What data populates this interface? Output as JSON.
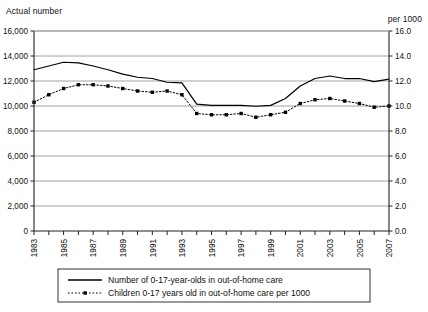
{
  "header": {
    "left_caption": "Actual number",
    "right_caption": "per 1000"
  },
  "chart_data": {
    "type": "line",
    "title": "",
    "xlabel": "",
    "ylabel": "Actual number",
    "y2label": "per 1000",
    "grid": true,
    "legend_position": "bottom",
    "xlim": [
      1983,
      2007
    ],
    "ylim": [
      0,
      16000
    ],
    "y2lim": [
      0.0,
      16.0
    ],
    "yticks": [
      0,
      2000,
      4000,
      6000,
      8000,
      10000,
      12000,
      14000,
      16000
    ],
    "yticklabels": [
      "0",
      "2,000",
      "4,000",
      "6,000",
      "8,000",
      "10,000",
      "12,000",
      "14,000",
      "16,000"
    ],
    "y2ticks": [
      0.0,
      2.0,
      4.0,
      6.0,
      8.0,
      10.0,
      12.0,
      14.0,
      16.0
    ],
    "y2ticklabels": [
      "0.0",
      "2.0",
      "4.0",
      "6.0",
      "8.0",
      "10.0",
      "12.0",
      "14.0",
      "16.0"
    ],
    "x": [
      1983,
      1984,
      1985,
      1986,
      1987,
      1988,
      1989,
      1990,
      1991,
      1992,
      1993,
      1994,
      1995,
      1996,
      1997,
      1998,
      1999,
      2000,
      2001,
      2002,
      2003,
      2004,
      2005,
      2006,
      2007
    ],
    "xticklabels": [
      "1983",
      "",
      "1985",
      "",
      "1987",
      "",
      "1989",
      "",
      "1991",
      "",
      "1993",
      "",
      "1995",
      "",
      "1997",
      "",
      "1999",
      "",
      "2001",
      "",
      "2003",
      "",
      "2005",
      "",
      "2007"
    ],
    "series": [
      {
        "name": "Number of 0-17-year-olds in out-of-home care",
        "axis": "left",
        "style": "solid",
        "marker": "none",
        "color": "#000000",
        "values": [
          12900,
          13200,
          13500,
          13450,
          13200,
          12900,
          12550,
          12300,
          12200,
          11900,
          11850,
          10150,
          10050,
          10050,
          10050,
          9980,
          10050,
          10600,
          11600,
          12200,
          12400,
          12200,
          12200,
          11950,
          12150
        ]
      },
      {
        "name": "Children 0-17 years old in out-of-home care per 1000",
        "axis": "right",
        "style": "dotted",
        "marker": "square",
        "color": "#000000",
        "values": [
          10.3,
          10.9,
          11.4,
          11.7,
          11.7,
          11.6,
          11.4,
          11.2,
          11.1,
          11.2,
          10.9,
          9.4,
          9.3,
          9.3,
          9.4,
          9.1,
          9.3,
          9.5,
          10.2,
          10.5,
          10.6,
          10.4,
          10.2,
          9.9,
          10.0
        ]
      }
    ]
  },
  "legend": {
    "items": [
      {
        "label": "Number of 0-17-year-olds in out-of-home care",
        "style": "solid"
      },
      {
        "label": "Children 0-17 years old in out-of-home care per 1000",
        "style": "dotted"
      }
    ]
  }
}
